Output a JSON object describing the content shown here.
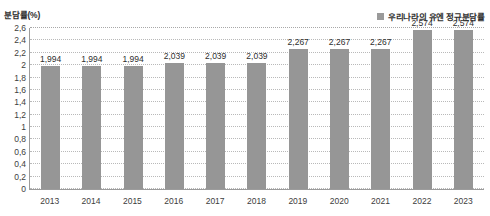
{
  "chart_data": {
    "type": "bar",
    "title": "",
    "subtitle": "",
    "xlabel": "",
    "ylabel": "분담률(%)",
    "categories": [
      "2013",
      "2014",
      "2015",
      "2016",
      "2017",
      "2018",
      "2019",
      "2020",
      "2021",
      "2022",
      "2023"
    ],
    "values": [
      1.994,
      1.994,
      1.994,
      2.039,
      2.039,
      2.039,
      2.267,
      2.267,
      2.267,
      2.574,
      2.574
    ],
    "value_labels": [
      "1,994",
      "1,994",
      "1,994",
      "2,039",
      "2,039",
      "2,039",
      "2,267",
      "2,267",
      "2,267",
      "2,574",
      "2,574"
    ],
    "series": [
      {
        "name": "우리나라의 유엔 정규분담률",
        "values": [
          1.994,
          1.994,
          1.994,
          2.039,
          2.039,
          2.039,
          2.267,
          2.267,
          2.267,
          2.574,
          2.574
        ],
        "color": "#969696"
      }
    ],
    "ylim": [
      0,
      2.6
    ],
    "ytick_values": [
      0,
      0.2,
      0.4,
      0.6,
      0.8,
      1,
      1.2,
      1.4,
      1.6,
      1.8,
      2,
      2.2,
      2.4,
      2.6
    ],
    "ytick_labels": [
      "0",
      "0,2",
      "0,4",
      "0,6",
      "0,8",
      "1",
      "1,2",
      "1,4",
      "1,6",
      "1,8",
      "2",
      "2,2",
      "2,4",
      "2,6"
    ],
    "grid": true,
    "grid_style": "dotted",
    "legend_position": "top-right",
    "bar_color": "#969696",
    "axis_color": "#9c9c9c",
    "gridline_color": "#b9b9b9",
    "background": "#ffffff"
  },
  "axis": {
    "y_title": "분담률(%)"
  },
  "legend": {
    "entries": [
      {
        "label": "우리나라의 유엔 정규분담률",
        "color": "#969696"
      }
    ]
  }
}
